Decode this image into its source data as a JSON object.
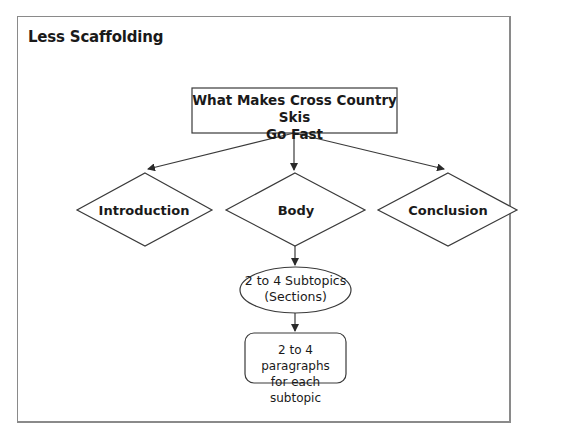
{
  "frame": {
    "title": "Less Scaffolding"
  },
  "nodes": {
    "topic": {
      "line1": "What Makes Cross Country Skis",
      "line2": "Go Fast",
      "shape": "rectangle"
    },
    "introduction": {
      "label": "Introduction",
      "shape": "diamond"
    },
    "body": {
      "label": "Body",
      "shape": "diamond"
    },
    "conclusion": {
      "label": "Conclusion",
      "shape": "diamond"
    },
    "subtopics": {
      "line1": "2 to 4 Subtopics",
      "line2": "(Sections)",
      "shape": "ellipse"
    },
    "paragraphs": {
      "line1": "2 to 4 paragraphs",
      "line2": "for each subtopic",
      "shape": "rounded-rectangle"
    }
  },
  "edges": [
    {
      "from": "topic",
      "to": "introduction"
    },
    {
      "from": "topic",
      "to": "body"
    },
    {
      "from": "topic",
      "to": "conclusion"
    },
    {
      "from": "body",
      "to": "subtopics"
    },
    {
      "from": "subtopics",
      "to": "paragraphs"
    }
  ],
  "colors": {
    "stroke": "#3a3a3a",
    "frame": "#8a8a8a",
    "text": "#1a1a1a"
  }
}
